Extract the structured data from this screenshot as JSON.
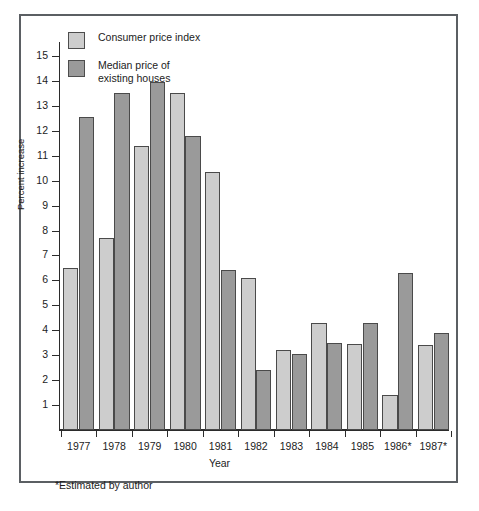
{
  "chart_data": {
    "type": "bar",
    "title": "",
    "xlabel": "Year",
    "ylabel": "Percent increase",
    "categories": [
      "1977",
      "1978",
      "1979",
      "1980",
      "1981",
      "1982",
      "1983",
      "1984",
      "1985",
      "1986*",
      "1987*"
    ],
    "series": [
      {
        "name": "Consumer price index",
        "color": "#cdcdcd",
        "values": [
          6.5,
          7.7,
          11.4,
          13.5,
          10.35,
          6.1,
          3.2,
          4.3,
          3.45,
          1.4,
          3.4
        ]
      },
      {
        "name": "Median price of\nexisting houses",
        "color": "#9a9a9a",
        "values": [
          12.55,
          13.5,
          13.95,
          11.8,
          6.4,
          2.4,
          3.05,
          3.5,
          4.3,
          6.3,
          3.9
        ]
      }
    ],
    "yticks": [
      1,
      2,
      3,
      4,
      5,
      6,
      7,
      8,
      9,
      10,
      11,
      12,
      13,
      14,
      15
    ],
    "ylim": [
      0,
      15.6
    ],
    "grid": false,
    "legend_position": "top-left",
    "footnote": "*Estimated by author"
  },
  "legend": {
    "items": [
      {
        "label": "Consumer price index",
        "color": "#cdcdcd"
      },
      {
        "label": "Median price of\nexisting houses",
        "color": "#9a9a9a"
      }
    ]
  },
  "colors": {
    "series_light": "#cdcdcd",
    "series_dark": "#9a9a9a",
    "axis": "#2b2b2b",
    "frame": "#5b5f63",
    "text": "#1c1c1c"
  }
}
